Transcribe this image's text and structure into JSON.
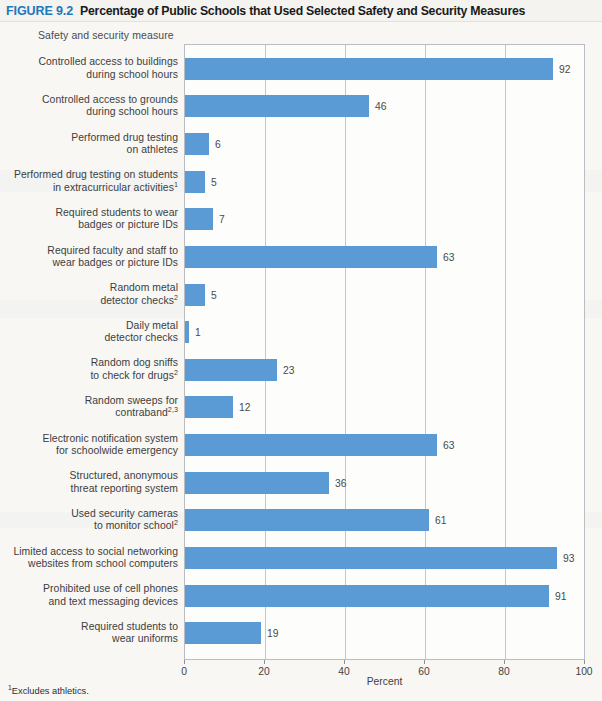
{
  "header": {
    "figure_label": "FIGURE 9.2",
    "title": "Percentage of Public Schools that Used Selected Safety and Security Measures"
  },
  "axis_title_top": "Safety and security measure",
  "footnotes": [
    {
      "marker": "1",
      "text": "Excludes athletics."
    }
  ],
  "colors": {
    "bar": "#5b9bd5",
    "figure_label": "#2277bb",
    "axis": "#b9bcc0",
    "gridline": "#c3c6ca",
    "page_background": "#f8f7f4"
  },
  "chart_data": {
    "type": "bar",
    "orientation": "horizontal",
    "title": "Percentage of Public Schools that Used Selected Safety and Security Measures",
    "xlabel": "Percent",
    "ylabel": "Safety and security measure",
    "xlim": [
      0,
      100
    ],
    "xticks": [
      0,
      20,
      40,
      60,
      80,
      100
    ],
    "xticklabels": [
      "0",
      "20",
      "40",
      "60",
      "80",
      "100"
    ],
    "grid": "vertical",
    "legend": "none",
    "categories": [
      "Controlled access to buildings during school hours",
      "Controlled access to grounds during school hours",
      "Performed drug testing on athletes",
      "Performed drug testing on students in extracurricular activities¹",
      "Required students to wear badges or picture IDs",
      "Required faculty and staff to wear badges or picture IDs",
      "Random metal detector checks²",
      "Daily metal detector checks",
      "Random dog sniffs to check for drugs²",
      "Random sweeps for contraband²·³",
      "Electronic notification system for schoolwide emergency",
      "Structured, anonymous threat reporting system",
      "Used security cameras to monitor school²",
      "Limited access to social networking websites from school computers",
      "Prohibited use of cell phones and text messaging devices",
      "Required students to wear uniforms"
    ],
    "values": [
      92,
      46,
      6,
      5,
      7,
      63,
      5,
      1,
      23,
      12,
      63,
      36,
      61,
      93,
      91,
      19
    ],
    "rows": [
      {
        "label_lines": [
          "Controlled access to buildings",
          "during school hours"
        ],
        "sup": "",
        "value": 92
      },
      {
        "label_lines": [
          "Controlled access to grounds",
          "during school hours"
        ],
        "sup": "",
        "value": 46
      },
      {
        "label_lines": [
          "Performed drug testing",
          "on athletes"
        ],
        "sup": "",
        "value": 6
      },
      {
        "label_lines": [
          "Performed drug testing on students",
          "in extracurricular activities"
        ],
        "sup": "1",
        "value": 5
      },
      {
        "label_lines": [
          "Required students to wear",
          "badges or picture IDs"
        ],
        "sup": "",
        "value": 7
      },
      {
        "label_lines": [
          "Required faculty and staff to",
          "wear badges or picture IDs"
        ],
        "sup": "",
        "value": 63
      },
      {
        "label_lines": [
          "Random metal",
          "detector checks"
        ],
        "sup": "2",
        "value": 5
      },
      {
        "label_lines": [
          "Daily metal",
          "detector checks"
        ],
        "sup": "",
        "value": 1
      },
      {
        "label_lines": [
          "Random dog sniffs",
          "to check for drugs"
        ],
        "sup": "2",
        "value": 23
      },
      {
        "label_lines": [
          "Random sweeps for",
          "contraband"
        ],
        "sup": "2,3",
        "value": 12
      },
      {
        "label_lines": [
          "Electronic notification system",
          "for schoolwide emergency"
        ],
        "sup": "",
        "value": 63
      },
      {
        "label_lines": [
          "Structured, anonymous",
          "threat reporting system"
        ],
        "sup": "",
        "value": 36
      },
      {
        "label_lines": [
          "Used security cameras",
          "to monitor school"
        ],
        "sup": "2",
        "value": 61
      },
      {
        "label_lines": [
          "Limited access to social networking",
          "websites from school computers"
        ],
        "sup": "",
        "value": 93
      },
      {
        "label_lines": [
          "Prohibited use of cell phones",
          "and text messaging devices"
        ],
        "sup": "",
        "value": 91
      },
      {
        "label_lines": [
          "Required students to",
          "wear uniforms"
        ],
        "sup": "",
        "value": 19
      }
    ]
  }
}
